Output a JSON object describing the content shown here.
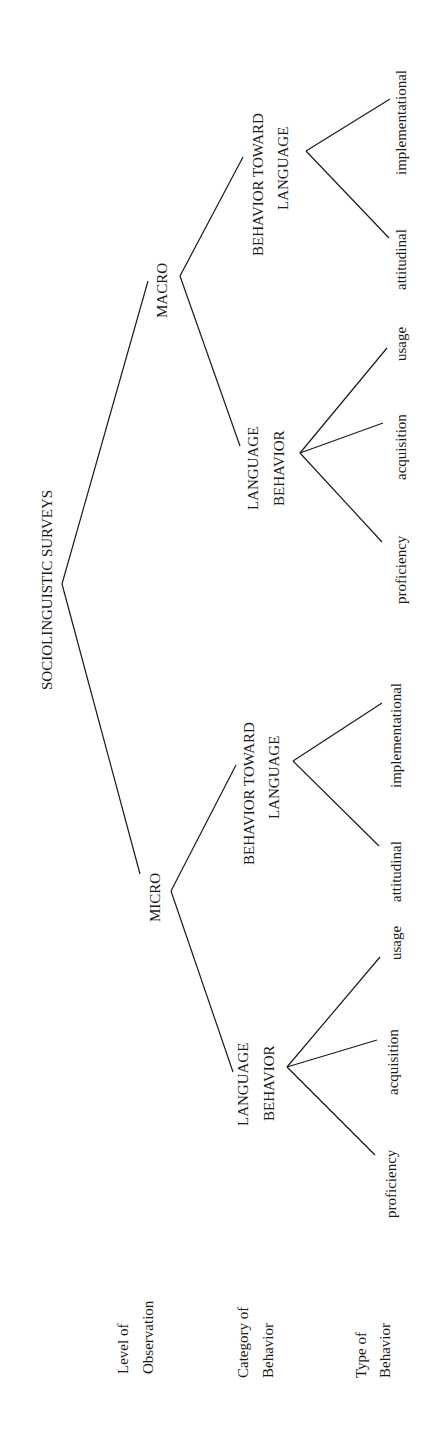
{
  "row_labels": {
    "level": [
      "Level of",
      "Observation"
    ],
    "category": [
      "Category of",
      "Behavior"
    ],
    "type": [
      "Type of",
      "Behavior"
    ]
  },
  "tree": {
    "root": "SOCIOLINGUISTIC SURVEYS",
    "micro": {
      "label": "MICRO",
      "language_behavior": {
        "label": [
          "LANGUAGE",
          "BEHAVIOR"
        ],
        "types": [
          "proficiency",
          "acquisition",
          "usage"
        ]
      },
      "behavior_toward_language": {
        "label": [
          "BEHAVIOR TOWARD",
          "LANGUAGE"
        ],
        "types": [
          "attitudinal",
          "implementational"
        ]
      }
    },
    "macro": {
      "label": "MACRO",
      "language_behavior": {
        "label": [
          "LANGUAGE",
          "BEHAVIOR"
        ],
        "types": [
          "proficiency",
          "acquisition",
          "usage"
        ]
      },
      "behavior_toward_language": {
        "label": [
          "BEHAVIOR TOWARD",
          "LANGUAGE"
        ],
        "types": [
          "attitudinal",
          "implementational"
        ]
      }
    }
  }
}
